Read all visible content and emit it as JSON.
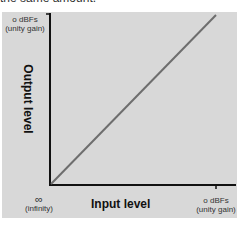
{
  "caption_fragment": "the same amount.",
  "diagram": {
    "y_axis": {
      "title": "Output level",
      "top_label_line1": "o dBFs",
      "top_label_line2": "(unity gain)"
    },
    "x_axis": {
      "title": "Input level",
      "left_label_line1": "∞",
      "left_label_line2": "(infinity)",
      "right_label_line1": "o dBFs",
      "right_label_line2": "(unity gain)"
    },
    "line": {
      "description": "unity transfer (diagonal)",
      "color": "#6e6e6e"
    },
    "colors": {
      "panel": "#d8d8d8",
      "axis": "#111111"
    }
  }
}
